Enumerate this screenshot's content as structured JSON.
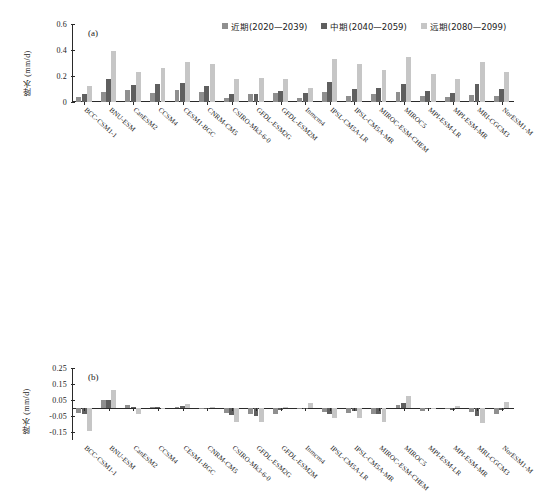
{
  "figure": {
    "background": "#ffffff",
    "series_colors": [
      "#8f8f8f",
      "#5f5f5f",
      "#c6c6c6"
    ]
  },
  "legend": {
    "position": "top-right",
    "items": [
      {
        "label": "近期(2020—2039)",
        "color": "#8f8f8f"
      },
      {
        "label": "中期(2040—2059)",
        "color": "#5f5f5f"
      },
      {
        "label": "远期(2080—2099)",
        "color": "#c6c6c6"
      }
    ]
  },
  "panel_a": {
    "tag": "(a)",
    "ylabel": "降水 (mm/d)",
    "yticks": [
      "0.6",
      "0.4",
      "0.2",
      "0"
    ]
  },
  "panel_b": {
    "tag": "(b)",
    "ylabel": "降水 (mm/d)",
    "yticks": [
      "0.25",
      "0.15",
      "0.05",
      "-0.05",
      "-0.15"
    ]
  },
  "chart_data": [
    {
      "type": "bar",
      "panel": "(a)",
      "title": "",
      "xlabel": "",
      "ylabel": "降水 (mm/d)",
      "ylim": [
        0,
        0.6
      ],
      "yticks": [
        0,
        0.2,
        0.4,
        0.6
      ],
      "grid": false,
      "legend_position": "top-right",
      "categories": [
        "BCC-CSM1-1",
        "BNU-ESM",
        "CanESM2",
        "CCSM4",
        "CESM1-BGC",
        "CNRM-CM5",
        "CSIRO-Mk3-6-0",
        "GFDL-ESM2G",
        "GFDL-ESM2M",
        "Inmcm4",
        "IPSL-CM5A-LR",
        "IPSL-CM5A-MR",
        "MIROC-ESM-CHEM",
        "MIROC5",
        "MPI-ESM-LR",
        "MPI-ESM-MR",
        "MRI-CGCM3",
        "NorESM1-M"
      ],
      "series": [
        {
          "name": "近期(2020—2039)",
          "color": "#8f8f8f",
          "values": [
            0.035,
            0.075,
            0.095,
            0.07,
            0.09,
            0.08,
            0.03,
            0.065,
            0.07,
            0.03,
            0.075,
            0.05,
            0.06,
            0.075,
            0.045,
            0.035,
            0.055,
            0.05
          ]
        },
        {
          "name": "中期(2040—2059)",
          "color": "#5f5f5f",
          "values": [
            0.065,
            0.18,
            0.13,
            0.14,
            0.15,
            0.125,
            0.06,
            0.065,
            0.085,
            0.07,
            0.155,
            0.1,
            0.11,
            0.135,
            0.085,
            0.07,
            0.14,
            0.1
          ]
        },
        {
          "name": "远期(2080—2099)",
          "color": "#c6c6c6",
          "values": [
            0.125,
            0.39,
            0.23,
            0.265,
            0.31,
            0.295,
            0.175,
            0.185,
            0.175,
            0.11,
            0.33,
            0.29,
            0.25,
            0.35,
            0.215,
            0.175,
            0.31,
            0.23
          ]
        }
      ]
    },
    {
      "type": "bar",
      "panel": "(b)",
      "title": "",
      "xlabel": "",
      "ylabel": "降水 (mm/d)",
      "ylim": [
        -0.2,
        0.25
      ],
      "yticks": [
        -0.15,
        -0.05,
        0.05,
        0.15,
        0.25
      ],
      "grid": false,
      "legend_position": "shared-with-panel-a",
      "categories": [
        "BCC-CSM1-1",
        "BNU-ESM",
        "CanESM2",
        "CCSM4",
        "CESM1-BGC",
        "CNRM-CM5",
        "CSIRO-Mk3-6-0",
        "GFDL-ESM2G",
        "GFDL-ESM2M",
        "Inmcm4",
        "IPSL-CM5A-LR",
        "IPSL-CM5A-MR",
        "MIROC-ESM-CHEM",
        "MIROC5",
        "MPI-ESM-LR",
        "MPI-ESM-MR",
        "MRI-CGCM3",
        "NorESM1-M"
      ],
      "series": [
        {
          "name": "近期(2020—2039)",
          "color": "#8f8f8f",
          "values": [
            -0.03,
            0.05,
            0.018,
            0.008,
            0.008,
            0.0,
            -0.03,
            -0.035,
            -0.035,
            0.0,
            -0.025,
            -0.03,
            -0.035,
            0.018,
            -0.018,
            -0.005,
            -0.028,
            -0.035
          ]
        },
        {
          "name": "中期(2040—2059)",
          "color": "#5f5f5f",
          "values": [
            -0.04,
            0.05,
            0.005,
            0.008,
            0.013,
            0.0,
            -0.045,
            -0.05,
            -0.01,
            0.0,
            -0.04,
            -0.018,
            -0.04,
            0.03,
            -0.008,
            -0.01,
            -0.05,
            -0.01
          ]
        },
        {
          "name": "远期(2080—2099)",
          "color": "#c6c6c6",
          "values": [
            -0.145,
            0.115,
            -0.04,
            0.0,
            0.025,
            0.008,
            -0.085,
            -0.09,
            0.008,
            0.03,
            -0.06,
            -0.065,
            -0.085,
            0.075,
            -0.008,
            0.013,
            -0.095,
            0.035
          ]
        }
      ]
    }
  ]
}
